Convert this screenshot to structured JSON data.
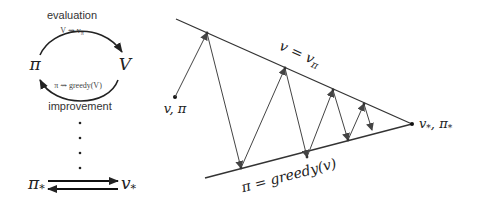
{
  "left_cycle": {
    "top_label": "evaluation",
    "top_sublabel": "V ⇝ v_π",
    "top_sublabel_main": "V ⇝ v",
    "top_sublabel_sub": "π",
    "left_node": "π",
    "right_node": "V",
    "bottom_sublabel": "π ⇝ greedy(V)",
    "bottom_label": "improvement",
    "dots": [
      "•",
      "•",
      "•",
      "•"
    ],
    "optimal_left": "π",
    "optimal_left_sub": "*",
    "optimal_right": "v",
    "optimal_right_sub": "*"
  },
  "right_diagram": {
    "start_label": "v, π",
    "top_line_label_main": "v = v",
    "top_line_label_sub": "π",
    "bottom_line_label": "π = greedy(v)",
    "end_label_v": "v",
    "end_label_pi": "π",
    "end_label_sub": "*",
    "end_label_sep": ", ",
    "line_color": "#333333",
    "arrow_color": "#555555"
  }
}
